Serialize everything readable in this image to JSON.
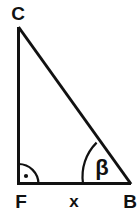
{
  "figure": {
    "type": "right-triangle-diagram",
    "background_color": "#ffffff",
    "stroke_color": "#111111",
    "vertices": {
      "C": {
        "label": "C",
        "x": 18,
        "y": 27
      },
      "F": {
        "label": "F",
        "x": 18,
        "y": 184
      },
      "B": {
        "label": "B",
        "x": 131,
        "y": 184
      }
    },
    "labels": {
      "apex": "C",
      "right_angle_vertex": "F",
      "angle_vertex": "B",
      "base_side": "x",
      "angle": "β"
    },
    "markers": {
      "right_angle": {
        "name": "right-angle-mark",
        "at_vertex": "F",
        "radius": 20,
        "has_center_dot": true
      },
      "angle_arc": {
        "name": "angle-beta-arc",
        "at_vertex": "B",
        "radius": 48,
        "label": "β"
      }
    }
  }
}
